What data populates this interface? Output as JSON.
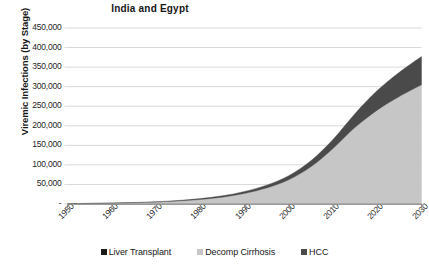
{
  "chart_data": {
    "type": "area",
    "stacked": true,
    "title": "India and Egypt",
    "xlabel": "",
    "ylabel": "Viremic Infections (by Stage)",
    "xlim": [
      1950,
      2030
    ],
    "ylim": [
      0,
      450000
    ],
    "grid": true,
    "legend_position": "bottom",
    "y_tick_labels": [
      "450,000",
      "400,000",
      "350,000",
      "300,000",
      "250,000",
      "200,000",
      "150,000",
      "100,000",
      "50,000",
      "-"
    ],
    "y_tick_values": [
      450000,
      400000,
      350000,
      300000,
      250000,
      200000,
      150000,
      100000,
      50000,
      0
    ],
    "x_tick_labels": [
      "1950",
      "1960",
      "1970",
      "1980",
      "1990",
      "2000",
      "2010",
      "2020",
      "2030"
    ],
    "x_tick_values": [
      1950,
      1960,
      1970,
      1980,
      1990,
      2000,
      2010,
      2020,
      2030
    ],
    "x": [
      1950,
      1955,
      1960,
      1965,
      1970,
      1975,
      1980,
      1985,
      1990,
      1995,
      2000,
      2005,
      2010,
      2015,
      2020,
      2025,
      2030
    ],
    "series": [
      {
        "name": "Liver Transplant",
        "color": "#1a1a1a",
        "values": [
          0,
          0,
          0,
          0,
          0,
          0,
          0,
          0,
          0,
          0,
          0,
          0,
          0,
          0,
          0,
          0,
          0
        ]
      },
      {
        "name": "Decomp Cirrhosis",
        "color": "#c6c6c6",
        "values": [
          900,
          1400,
          2100,
          3200,
          4800,
          7500,
          11500,
          17500,
          27000,
          41000,
          62000,
          95000,
          142000,
          196000,
          240000,
          275000,
          305000
        ]
      },
      {
        "name": "HCC",
        "color": "#4a4a4a",
        "values": [
          200,
          300,
          450,
          700,
          1000,
          1500,
          2300,
          3400,
          5000,
          7200,
          10500,
          15500,
          23000,
          35500,
          50000,
          62000,
          72000
        ]
      }
    ],
    "totals": [
      1100,
      1700,
      2550,
      3900,
      5800,
      9000,
      13800,
      20900,
      32000,
      48200,
      72500,
      110500,
      165000,
      231500,
      290000,
      337000,
      377000
    ]
  },
  "legend": {
    "items": [
      {
        "label": "Liver Transplant",
        "color": "#1a1a1a"
      },
      {
        "label": "Decomp Cirrhosis",
        "color": "#c6c6c6"
      },
      {
        "label": "HCC",
        "color": "#4a4a4a"
      }
    ]
  },
  "colors": {
    "gridline": "#d9d9d9",
    "axis": "#8c8c8c",
    "text": "#262626",
    "background": "#ffffff"
  }
}
